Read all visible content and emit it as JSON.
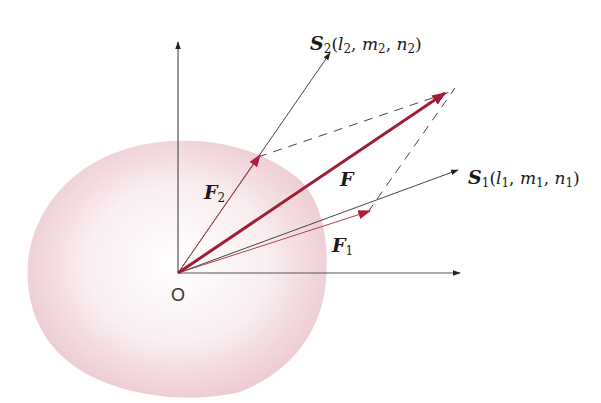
{
  "diagram": {
    "origin_label": "O",
    "vectors": {
      "F": {
        "label": "F",
        "color": "#a01e35"
      },
      "F1": {
        "label": "F",
        "sub": "1",
        "color": "#b0404f"
      },
      "F2": {
        "label": "F",
        "sub": "2",
        "color": "#b0404f"
      }
    },
    "directions": {
      "S1": {
        "label": "S",
        "sub": "1",
        "l": "l",
        "l_sub": "1",
        "m": "m",
        "m_sub": "1",
        "n": "n",
        "n_sub": "1"
      },
      "S2": {
        "label": "S",
        "sub": "2",
        "l": "l",
        "l_sub": "2",
        "m": "m",
        "m_sub": "2",
        "n": "n",
        "n_sub": "2"
      }
    },
    "colors": {
      "body_fill": "#f2d9de",
      "axis": "#555555",
      "force": "#a01e35",
      "component": "#b0404f",
      "dashed": "#444444"
    }
  }
}
